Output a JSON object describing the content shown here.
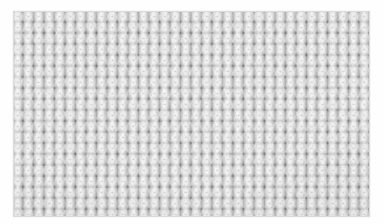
{
  "image": {
    "kind": "photograph",
    "subject": "knitted-fabric-swatch",
    "description": "Close-up macro photograph of a light grey ribbed knit fabric swatch",
    "stitch_pattern": "ribbed knit (vertical wales with purl gutters)",
    "material": "wool yarn",
    "alt_text": "Macro photograph of off-white / light grey ribbed knit wool fabric filling the frame",
    "frame": {
      "background_color": "#ffffff",
      "margin_left_px": 14,
      "margin_top_px": 12,
      "margin_right_px": 15,
      "margin_bottom_px": 8
    },
    "swatch": {
      "x_px": 14,
      "y_px": 12,
      "width_px": 355,
      "height_px": 204,
      "wale_count": 34,
      "course_count": 18,
      "wale_period_px": 10.5,
      "course_period_px": 11
    },
    "palette": {
      "yarn_base": "#dddddd",
      "yarn_highlight": "#fbfbfb",
      "yarn_midtone": "#c4c4c4",
      "yarn_shadow": "#8e8e8e",
      "deep_shadow": "#5a5a5a",
      "frame_white": "#fefefe"
    }
  }
}
